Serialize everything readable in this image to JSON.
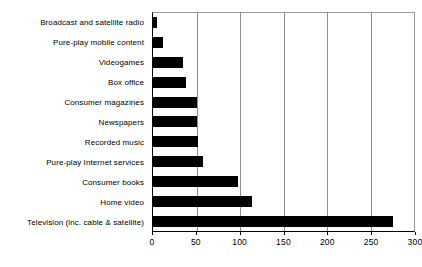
{
  "chart_data": {
    "type": "bar",
    "orientation": "horizontal",
    "title": "",
    "subtitle": "",
    "xlabel": "",
    "ylabel": "",
    "xlim": [
      0,
      300
    ],
    "xticks": [
      0,
      50,
      100,
      150,
      200,
      250,
      300
    ],
    "xtick_labels": [
      "0",
      "50",
      "100",
      "150",
      "200",
      "250",
      "300"
    ],
    "grid": "vertical",
    "legend": "none",
    "bar_color": "#000000",
    "categories": [
      "Broadcast and satellite radio",
      "Pure-play mobile content",
      "Videogames",
      "Box office",
      "Consumer magazines",
      "Newspapers",
      "Recorded music",
      "Pure-play Internet services",
      "Consumer books",
      "Home video",
      "Television (inc. cable & satellite)"
    ],
    "values": [
      5,
      11,
      34,
      38,
      50,
      50,
      51,
      57,
      97,
      113,
      274
    ]
  },
  "axis": {
    "plot_left_px": 152,
    "plot_right_px": 415
  }
}
